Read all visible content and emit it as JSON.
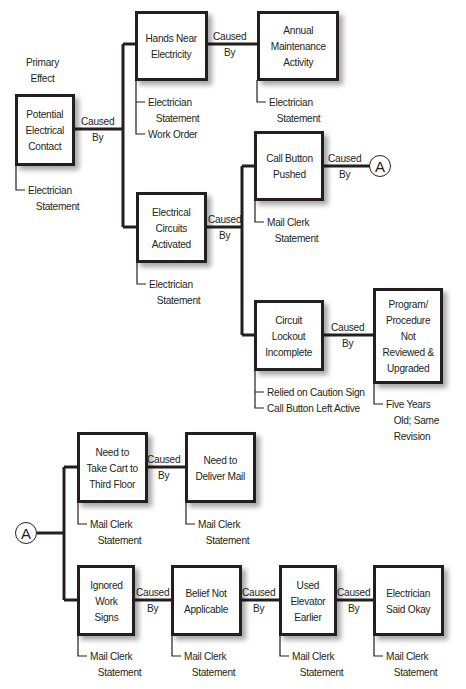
{
  "diagram": {
    "type": "cause-and-effect tree",
    "primary_label": "Primary\nEffect",
    "caused_by_label": "Caused\nBy",
    "connector_label": "A",
    "colors": {
      "line": "#231f20",
      "box_fill": "#ffffff",
      "background": "#ffffff"
    },
    "nodes": {
      "potential_contact": {
        "label": "Potential\nElectrical\nContact",
        "evidence": [
          "Electrician",
          "   Statement"
        ]
      },
      "hands_near": {
        "label": "Hands Near\nElectricity",
        "evidence": [
          "Electrician",
          "   Statement",
          "Work Order"
        ]
      },
      "annual_maint": {
        "label": "Annual\nMaintenance\nActivity",
        "evidence": [
          "Electrician",
          "   Statement"
        ]
      },
      "circuits_activated": {
        "label": "Electrical\nCircuits\nActivated",
        "evidence": [
          "Electrician",
          "   Statement"
        ]
      },
      "call_button": {
        "label": "Call Button\nPushed",
        "evidence": [
          "Mail Clerk",
          "   Statement"
        ]
      },
      "lockout": {
        "label": "Circuit\nLockout\nIncomplete",
        "evidence": [
          "Relied on Caution Sign",
          "Call Button Left Active"
        ]
      },
      "program": {
        "label": "Program/\nProcedure\nNot\nReviewed &\nUpgraded",
        "evidence": [
          "Five Years",
          "   Old; Same",
          "   Revision"
        ]
      },
      "take_cart": {
        "label": "Need to\nTake Cart to\nThird Floor",
        "evidence": [
          "Mail Clerk",
          "   Statement"
        ]
      },
      "deliver_mail": {
        "label": "Need to\nDeliver Mail",
        "evidence": [
          "Mail Clerk",
          "   Statement"
        ]
      },
      "ignored_signs": {
        "label": "Ignored\nWork\nSigns",
        "evidence": [
          "Mail Clerk",
          "   Statement"
        ]
      },
      "belief": {
        "label": "Belief Not\nApplicable",
        "evidence": [
          "Mail Clerk",
          "   Statement"
        ]
      },
      "used_elevator": {
        "label": "Used\nElevator\nEarlier",
        "evidence": [
          "Mail Clerk",
          "   Statement"
        ]
      },
      "electrician_okay": {
        "label": "Electrician\nSaid Okay",
        "evidence": [
          "Mail Clerk",
          "   Statement"
        ]
      }
    }
  }
}
